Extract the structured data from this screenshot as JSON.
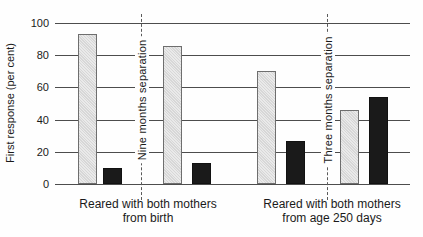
{
  "chart_data": {
    "type": "bar",
    "title": "",
    "xlabel": "",
    "ylabel": "First response (per cent)",
    "ylim": [
      0,
      100
    ],
    "yticks": [
      0,
      20,
      40,
      60,
      80,
      100
    ],
    "grid": true,
    "legend_position": "none",
    "series": [
      {
        "name": "light-bar",
        "color": "#dedede",
        "values": [
          93,
          86,
          70,
          46
        ]
      },
      {
        "name": "dark-bar",
        "color": "#1a1a1a",
        "values": [
          10,
          13,
          27,
          54
        ]
      }
    ],
    "pair_groups": [
      {
        "label_line1": "Reared with both mothers",
        "label_line2": "from birth",
        "divider_label": "Nine months separation",
        "pairs": [
          {
            "light": 93,
            "dark": 10
          },
          {
            "light": 86,
            "dark": 13
          }
        ]
      },
      {
        "label_line1": "Reared with both mothers",
        "label_line2": "from age 250 days",
        "divider_label": "Three months separation",
        "pairs": [
          {
            "light": 70,
            "dark": 27
          },
          {
            "light": 46,
            "dark": 54
          }
        ]
      }
    ]
  },
  "colors": {
    "background": "#fefefe",
    "gridline": "#4d4d4d",
    "text": "#1a1a1a",
    "light_bar_fill": "#dedede",
    "light_bar_border": "#6e6e6e",
    "dark_bar_fill": "#1a1a1a",
    "divider_line": "#5a5a5a"
  }
}
